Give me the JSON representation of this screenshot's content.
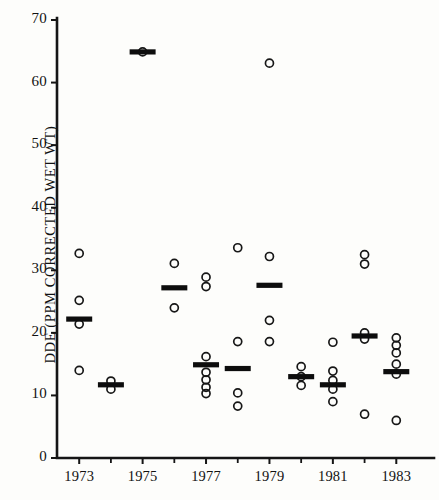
{
  "chart_data": {
    "type": "scatter",
    "title": "",
    "subtitle": "",
    "xlabel": "",
    "ylabel": "DDE (PPM CORRECTED WET WT)",
    "xlim": [
      1972.3,
      1984.0
    ],
    "ylim": [
      0,
      70
    ],
    "yticks": [
      0,
      10,
      20,
      30,
      40,
      50,
      60,
      70
    ],
    "ytick_labels": [
      "0",
      "10",
      "20",
      "30",
      "40",
      "50",
      "60",
      "70"
    ],
    "xticks": [
      1973,
      1974,
      1975,
      1976,
      1977,
      1978,
      1979,
      1980,
      1981,
      1982,
      1983
    ],
    "xtick_labels": [
      "1973",
      "",
      "1975",
      "",
      "1977",
      "",
      "1979",
      "",
      "1981",
      "",
      "1983"
    ],
    "grid": false,
    "legend": false,
    "marker": "open-circle",
    "mean_marker": "horizontal-bar",
    "series": [
      {
        "name": "1973",
        "x": 1973,
        "values": [
          32.7,
          25.2,
          21.4,
          14.0
        ],
        "mean": 22.2
      },
      {
        "name": "1974",
        "x": 1974,
        "values": [
          12.3,
          11.0
        ],
        "mean": 11.7
      },
      {
        "name": "1975",
        "x": 1975,
        "values": [
          64.9
        ],
        "mean": 64.9
      },
      {
        "name": "1976",
        "x": 1976,
        "values": [
          31.1,
          24.0
        ],
        "mean": 27.2
      },
      {
        "name": "1977",
        "x": 1977,
        "values": [
          28.9,
          27.4,
          16.2,
          13.7,
          12.5,
          11.3,
          10.3
        ],
        "mean": 14.9
      },
      {
        "name": "1978",
        "x": 1978,
        "values": [
          33.6,
          18.6,
          10.4,
          8.3
        ],
        "mean": 14.3
      },
      {
        "name": "1979",
        "x": 1979,
        "values": [
          63.1,
          32.2,
          22.0,
          18.6
        ],
        "mean": 27.6
      },
      {
        "name": "1980",
        "x": 1980,
        "values": [
          14.6,
          13.0,
          11.6
        ],
        "mean": 13.0
      },
      {
        "name": "1981",
        "x": 1981,
        "values": [
          18.5,
          13.9,
          12.4,
          11.0,
          9.0
        ],
        "mean": 11.7
      },
      {
        "name": "1982",
        "x": 1982,
        "values": [
          32.5,
          31.0,
          20.0,
          19.0,
          7.0
        ],
        "mean": 19.5
      },
      {
        "name": "1983",
        "x": 1983,
        "values": [
          19.2,
          18.0,
          16.8,
          15.0,
          13.4,
          6.0
        ],
        "mean": 13.8
      }
    ]
  },
  "axes": {
    "y_axis_label": "DDE (PPM CORRECTED WET WT)",
    "y_tick_values": [
      "70",
      "60",
      "50",
      "40",
      "30",
      "20",
      "10",
      "0"
    ],
    "x_tick_values": [
      "1973",
      "1975",
      "1977",
      "1979",
      "1981",
      "1983"
    ]
  }
}
